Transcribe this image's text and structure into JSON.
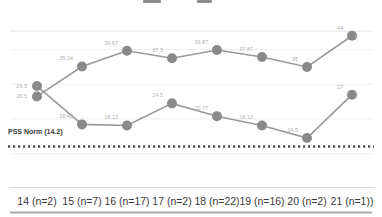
{
  "chart_data": {
    "type": "line",
    "categories": [
      "14 (n=2)",
      "15 (n=7)",
      "16 (n=17)",
      "17 (n=2)",
      "18 (n=22)",
      "19 (n=16)",
      "20 (n=2)",
      "21 (n=1))"
    ],
    "series": [
      {
        "name": "upper-series",
        "values": [
          26.5,
          35.14,
          39.67,
          37.5,
          39.87,
          37.87,
          35,
          44
        ]
      },
      {
        "name": "lower-series",
        "values": [
          29.5,
          18.43,
          18.12,
          24.5,
          20.77,
          18.12,
          14.5,
          27
        ]
      }
    ],
    "point_labels_shown": true,
    "norm_line": {
      "label": "PSS Norm (14.2)",
      "value": 14.2
    },
    "xlabel": "",
    "ylabel": "",
    "ylim": [
      10,
      46
    ],
    "gridlines": [
      10,
      20,
      30,
      40
    ],
    "legend": "none",
    "colors": {
      "line": "#9a9a9a",
      "point": "#8a8a8a",
      "point_label": "#b2b2b2",
      "norm_line": "#4d4d4d",
      "axis_label": "#3a3a3a",
      "gridline": "#efefef",
      "plot_border": "#e4e4e4",
      "separator": "#d8d8d8",
      "baseline": "#aaaaaa"
    }
  }
}
